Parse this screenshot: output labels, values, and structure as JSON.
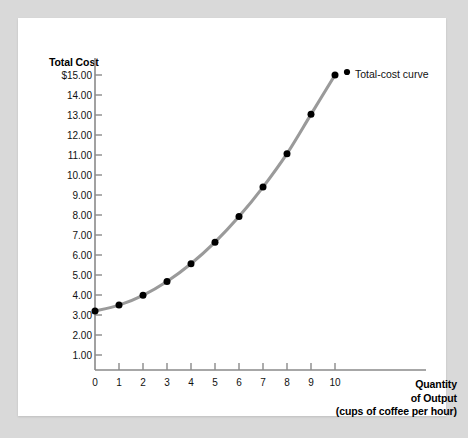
{
  "figure": {
    "panel_background": "#ffffff",
    "outer_background": "#d9d9d9",
    "axis_color": "#8a8a8a",
    "curve_color": "#9a9a9a",
    "marker_color": "#000000"
  },
  "chart_data": {
    "type": "line",
    "title": "",
    "xlabel": "Quantity of Output (cups of coffee per hour)",
    "ylabel": "Total Cost",
    "xlabel_lines": [
      "Quantity",
      "of Output",
      "(cups of coffee per hour)"
    ],
    "x": [
      0,
      1,
      2,
      3,
      4,
      5,
      6,
      7,
      8,
      9,
      10
    ],
    "values": [
      3.0,
      3.3,
      3.8,
      4.5,
      5.4,
      6.5,
      7.8,
      9.3,
      11.0,
      13.0,
      15.0
    ],
    "series": [
      {
        "name": "Total-cost curve",
        "values": [
          3.0,
          3.3,
          3.8,
          4.5,
          5.4,
          6.5,
          7.8,
          9.3,
          11.0,
          13.0,
          15.0
        ]
      }
    ],
    "legend_label": "Total-cost curve",
    "legend_position": "inline-right-of-last-point",
    "grid": false,
    "xlim": [
      0,
      10
    ],
    "ylim": [
      0,
      15
    ],
    "x_tick_labels": [
      "0",
      "1",
      "2",
      "3",
      "4",
      "5",
      "6",
      "7",
      "8",
      "9",
      "10"
    ],
    "y_tick_labels": [
      "1.00",
      "2.00",
      "3.00",
      "4.00",
      "5.00",
      "6.00",
      "7.00",
      "8.00",
      "9.00",
      "10.00",
      "11.00",
      "12.00",
      "13.00",
      "14.00",
      "$15.00"
    ],
    "y_tick_values": [
      1,
      2,
      3,
      4,
      5,
      6,
      7,
      8,
      9,
      10,
      11,
      12,
      13,
      14,
      15
    ],
    "origin_label": "0"
  }
}
